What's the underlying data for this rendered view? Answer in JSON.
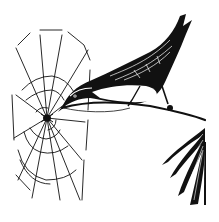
{
  "image": {
    "kind": "engraving illustration",
    "subjects": [
      "bird perched on branch",
      "spider web",
      "leaf cluster"
    ],
    "colors": {
      "ink": "#111111",
      "paper": "#ffffff"
    }
  }
}
